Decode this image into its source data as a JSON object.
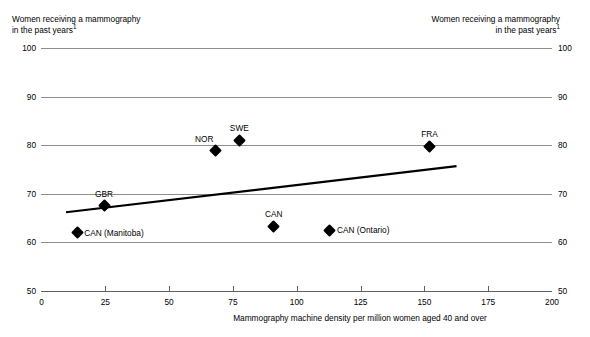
{
  "chart_data": {
    "type": "scatter",
    "title": "",
    "xlabel": "Mammography machine density per million women aged 40 and over",
    "ylabel": "Women receiving a mammography in the past years",
    "ylabel_footnote": "1",
    "xlim": [
      0,
      200
    ],
    "ylim": [
      50,
      100
    ],
    "xticks": [
      0,
      25,
      50,
      75,
      100,
      125,
      150,
      175,
      200
    ],
    "yticks": [
      50,
      60,
      70,
      80,
      90,
      100
    ],
    "grid": true,
    "legend": "none",
    "points": [
      {
        "label": "CAN (Manitoba)",
        "x": 14,
        "y": 62.0,
        "label_pos": "right"
      },
      {
        "label": "GBR",
        "x": 24.5,
        "y": 67.5,
        "label_pos": "above"
      },
      {
        "label": "NOR",
        "x": 68,
        "y": 79.0,
        "label_pos": "above-left"
      },
      {
        "label": "SWE",
        "x": 77.5,
        "y": 81.0,
        "label_pos": "above"
      },
      {
        "label": "CAN",
        "x": 91,
        "y": 63.3,
        "label_pos": "above"
      },
      {
        "label": "CAN (Ontario)",
        "x": 113,
        "y": 62.5,
        "label_pos": "right"
      },
      {
        "label": "FRA",
        "x": 152,
        "y": 79.8,
        "label_pos": "above"
      }
    ],
    "trendline": {
      "x_start": 9.6,
      "y_start": 66.2,
      "x_end": 162.6,
      "y_end": 75.7
    }
  },
  "axis_captions": {
    "left_line1": "Women receiving a mammography",
    "left_line2": "in the past years",
    "left_footnote": "1",
    "right_line1": "Women receiving a mammography",
    "right_line2": "in the past years",
    "right_footnote": "1"
  }
}
